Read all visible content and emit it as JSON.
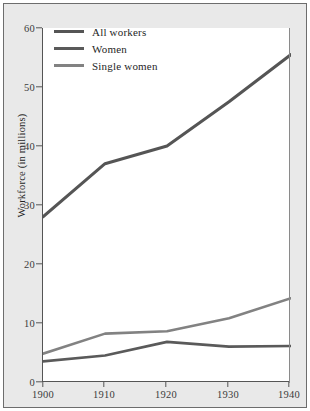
{
  "chart_data": {
    "type": "line",
    "title": "",
    "xlabel": "",
    "ylabel": "Workforce (in millions)",
    "x": [
      1900,
      1910,
      1920,
      1930,
      1940
    ],
    "xticklabels": [
      "1900",
      "1910",
      "1920",
      "1930",
      "1940"
    ],
    "yticklabels": [
      "0",
      "10",
      "20",
      "30",
      "40",
      "50",
      "60"
    ],
    "yticks": [
      0,
      10,
      20,
      30,
      40,
      50,
      60
    ],
    "xlim": [
      1900,
      1940
    ],
    "ylim": [
      0,
      60
    ],
    "grid": false,
    "legend_position": "upper left",
    "series": [
      {
        "name": "All workers",
        "values": [
          28.0,
          37.0,
          40.0,
          47.5,
          55.5
        ],
        "color": "#555555",
        "linewidth": 3.0
      },
      {
        "name": "Women",
        "values": [
          3.5,
          4.5,
          6.8,
          6.0,
          6.1
        ],
        "color": "#5a5a5a",
        "linewidth": 2.6
      },
      {
        "name": "Single women",
        "values": [
          4.8,
          8.2,
          8.6,
          10.8,
          14.2
        ],
        "color": "#828282",
        "linewidth": 2.6
      }
    ]
  },
  "figure": {
    "background_color": "#e9e9e9",
    "plot_background_color": "#ffffff",
    "border_color": "#6d6d6d",
    "axis_color": "#555555"
  }
}
